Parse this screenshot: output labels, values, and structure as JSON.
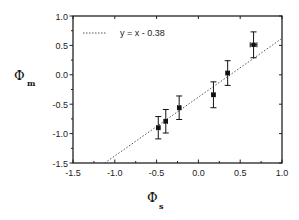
{
  "chart_data": {
    "type": "scatter",
    "title": "",
    "xlabel": "Φs",
    "xlabel_symbol": "Φ",
    "xlabel_sub": "s",
    "ylabel": "Φm",
    "ylabel_symbol": "Φ",
    "ylabel_sub": "m",
    "xlim": [
      -1.5,
      1.0
    ],
    "ylim": [
      -1.5,
      1.0
    ],
    "x_ticks": [
      -1.5,
      -1.0,
      -0.5,
      0.0,
      0.5,
      1.0
    ],
    "x_tick_labels": [
      "-1.5",
      "-1.0",
      "-0.5",
      "0.0",
      "0.5",
      "1.0"
    ],
    "y_ticks": [
      -1.5,
      -1.0,
      -0.5,
      0.0,
      0.5,
      1.0
    ],
    "y_tick_labels": [
      "-1.5",
      "-1.0",
      "-0.5",
      "0.0",
      "0.5",
      "1.0"
    ],
    "grid": false,
    "legend_position": "upper left",
    "series": [
      {
        "name": "data",
        "type": "scatter",
        "marker": "square",
        "color": "#111111",
        "x": [
          -0.48,
          -0.39,
          -0.23,
          0.18,
          0.35,
          0.66
        ],
        "y": [
          -0.9,
          -0.79,
          -0.56,
          -0.34,
          0.03,
          0.51
        ],
        "x_err": [
          0.02,
          0.02,
          0.02,
          0.02,
          0.02,
          0.04
        ],
        "y_err": [
          0.19,
          0.2,
          0.2,
          0.22,
          0.21,
          0.22
        ]
      },
      {
        "name": "y = x - 0.38",
        "type": "line",
        "style": "dotted",
        "color": "#555555",
        "slope": 1.0,
        "intercept": -0.38
      }
    ],
    "legend": [
      {
        "label": "y = x - 0.38",
        "style": "dotted"
      }
    ]
  }
}
